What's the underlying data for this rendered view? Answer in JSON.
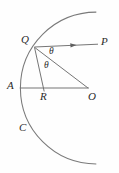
{
  "figure": {
    "background_color": "#fefefe",
    "stroke_color": "#6e6e6e",
    "label_color": "#2b2b2b",
    "width": 119,
    "height": 173,
    "points": [
      {
        "id": "Q",
        "label": "Q",
        "x": 34,
        "y": 47,
        "label_x": 21,
        "label_y": 34
      },
      {
        "id": "P",
        "label": "P",
        "x": 98,
        "y": 44,
        "label_x": 101,
        "label_y": 36
      },
      {
        "id": "A",
        "label": "A",
        "x": 20,
        "y": 88,
        "label_x": 7,
        "label_y": 80
      },
      {
        "id": "R",
        "label": "R",
        "x": 44,
        "y": 88,
        "label_x": 40,
        "label_y": 91
      },
      {
        "id": "O",
        "label": "O",
        "x": 88,
        "y": 88,
        "label_x": 88,
        "label_y": 91
      },
      {
        "id": "C",
        "label": "C",
        "x": 30,
        "y": 132,
        "label_x": 19,
        "label_y": 122
      }
    ],
    "angles": [
      {
        "id": "theta-upper",
        "label": "θ",
        "label_x": 49,
        "label_y": 47
      },
      {
        "id": "theta-lower",
        "label": "θ",
        "label_x": 44,
        "label_y": 61
      }
    ],
    "segments": [
      {
        "id": "ray-PQ",
        "from": "P",
        "to": "Q",
        "arrow": true
      },
      {
        "id": "segment-QO",
        "from": "Q",
        "to": "O",
        "arrow": false
      },
      {
        "id": "segment-QR",
        "from": "Q",
        "to": "R",
        "arrow": false
      },
      {
        "id": "segment-AO",
        "from": "A",
        "to": "O",
        "arrow": false
      }
    ],
    "arc": {
      "id": "circle-arc-C",
      "center_x": 88,
      "center_y": 88,
      "radius": 68,
      "start_x": 96,
      "start_y": 12,
      "end_x": 96,
      "end_y": 164
    }
  }
}
